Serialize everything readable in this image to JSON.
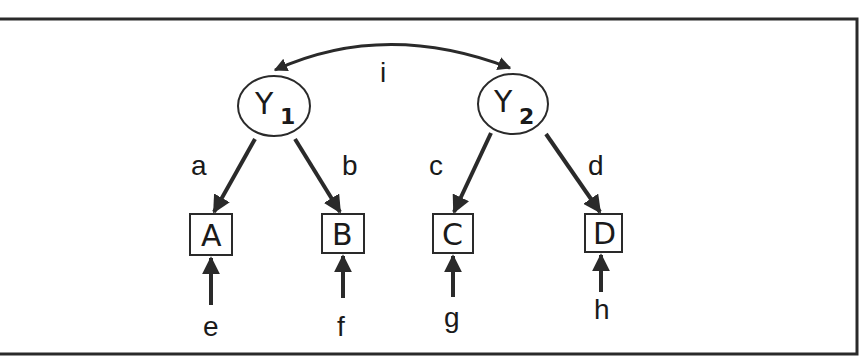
{
  "diagram": {
    "type": "path-diagram",
    "colors": {
      "stroke": "#2a2a2a",
      "background": "#ffffff"
    },
    "latent": [
      {
        "id": "Y1",
        "base": "Y",
        "sub": "1"
      },
      {
        "id": "Y2",
        "base": "Y",
        "sub": "2"
      }
    ],
    "observed": [
      {
        "id": "A",
        "label": "A"
      },
      {
        "id": "B",
        "label": "B"
      },
      {
        "id": "C",
        "label": "C"
      },
      {
        "id": "D",
        "label": "D"
      }
    ],
    "paths": [
      {
        "from": "Y1",
        "to": "A",
        "label": "a"
      },
      {
        "from": "Y1",
        "to": "B",
        "label": "b"
      },
      {
        "from": "Y2",
        "to": "C",
        "label": "c"
      },
      {
        "from": "Y2",
        "to": "D",
        "label": "d"
      }
    ],
    "errors": [
      {
        "to": "A",
        "label": "e"
      },
      {
        "to": "B",
        "label": "f"
      },
      {
        "to": "C",
        "label": "g"
      },
      {
        "to": "D",
        "label": "h"
      }
    ],
    "covariance": {
      "between": [
        "Y1",
        "Y2"
      ],
      "label": "i"
    }
  }
}
